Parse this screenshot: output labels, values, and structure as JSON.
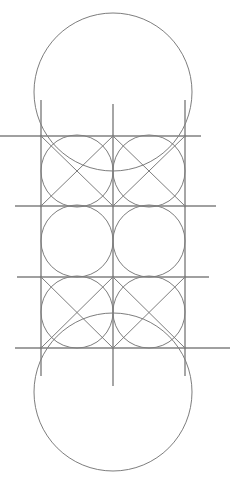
{
  "canvas": {
    "width": 230,
    "height": 483,
    "background_color": "#ffffff",
    "title": "Geometric construction diagram"
  },
  "style": {
    "circle_stroke_color": "#6e6e6e",
    "circle_stroke_width": 0.9,
    "grid_stroke_color": "#808080",
    "grid_stroke_width": 1.4,
    "diagonal_stroke_color": "#6e6e6e",
    "diagonal_stroke_width": 0.9
  },
  "grid": {
    "vertical_x": [
      41,
      113,
      185
    ],
    "horizontal_y": [
      136,
      206,
      277,
      348
    ],
    "cell_size": 71,
    "module_radius": 36
  },
  "figure": {
    "large_circles": [
      {
        "name": "top-large-circle",
        "cx": 113,
        "cy": 92,
        "r": 79
      },
      {
        "name": "bottom-large-circle",
        "cx": 113,
        "cy": 392,
        "r": 79
      }
    ],
    "module_circles": [
      {
        "name": "circle-r1c1",
        "cx": 77,
        "cy": 171,
        "r": 36
      },
      {
        "name": "circle-r1c2",
        "cx": 149,
        "cy": 171,
        "r": 36
      },
      {
        "name": "circle-r2c1",
        "cx": 77,
        "cy": 241,
        "r": 36
      },
      {
        "name": "circle-r2c2",
        "cx": 149,
        "cy": 241,
        "r": 36
      },
      {
        "name": "circle-r3c1",
        "cx": 77,
        "cy": 312,
        "r": 36
      },
      {
        "name": "circle-r3c2",
        "cx": 149,
        "cy": 312,
        "r": 36
      }
    ],
    "horizontal_lines": [
      {
        "name": "h-line-1",
        "x1": 0,
        "x2": 201,
        "y": 136
      },
      {
        "name": "h-line-2",
        "x1": 15,
        "x2": 216,
        "y": 206
      },
      {
        "name": "h-line-3",
        "x1": 17,
        "x2": 209,
        "y": 277
      },
      {
        "name": "h-line-4",
        "x1": 15,
        "x2": 230,
        "y": 348
      }
    ],
    "vertical_lines": [
      {
        "name": "v-line-left",
        "x": 41,
        "y1": 100,
        "y2": 376
      },
      {
        "name": "v-line-center",
        "x": 113,
        "y1": 104,
        "y2": 386
      },
      {
        "name": "v-line-right",
        "x": 185,
        "y1": 100,
        "y2": 376
      }
    ],
    "diagonals": [
      {
        "name": "diag-r1c1-down",
        "x1": 41,
        "y1": 136,
        "x2": 113,
        "y2": 206
      },
      {
        "name": "diag-r1c1-up",
        "x1": 41,
        "y1": 206,
        "x2": 113,
        "y2": 136
      },
      {
        "name": "diag-r1c2-down",
        "x1": 113,
        "y1": 136,
        "x2": 185,
        "y2": 206
      },
      {
        "name": "diag-r1c2-up",
        "x1": 113,
        "y1": 206,
        "x2": 185,
        "y2": 136
      },
      {
        "name": "diag-r3c1-down",
        "x1": 41,
        "y1": 277,
        "x2": 113,
        "y2": 348
      },
      {
        "name": "diag-r3c1-up",
        "x1": 41,
        "y1": 348,
        "x2": 113,
        "y2": 277
      },
      {
        "name": "diag-r3c2-down",
        "x1": 113,
        "y1": 277,
        "x2": 185,
        "y2": 348
      },
      {
        "name": "diag-r3c2-up",
        "x1": 113,
        "y1": 348,
        "x2": 185,
        "y2": 277
      }
    ],
    "node_points": [
      {
        "name": "node-1-1",
        "cx": 41,
        "cy": 136
      },
      {
        "name": "node-1-2",
        "cx": 113,
        "cy": 136
      },
      {
        "name": "node-1-3",
        "cx": 185,
        "cy": 136
      },
      {
        "name": "node-2-1",
        "cx": 41,
        "cy": 206
      },
      {
        "name": "node-2-2",
        "cx": 113,
        "cy": 206
      },
      {
        "name": "node-2-3",
        "cx": 185,
        "cy": 206
      },
      {
        "name": "node-3-1",
        "cx": 41,
        "cy": 277
      },
      {
        "name": "node-3-2",
        "cx": 113,
        "cy": 277
      },
      {
        "name": "node-3-3",
        "cx": 185,
        "cy": 277
      },
      {
        "name": "node-4-1",
        "cx": 41,
        "cy": 348
      },
      {
        "name": "node-4-2",
        "cx": 113,
        "cy": 348
      },
      {
        "name": "node-4-3",
        "cx": 185,
        "cy": 348
      }
    ]
  }
}
